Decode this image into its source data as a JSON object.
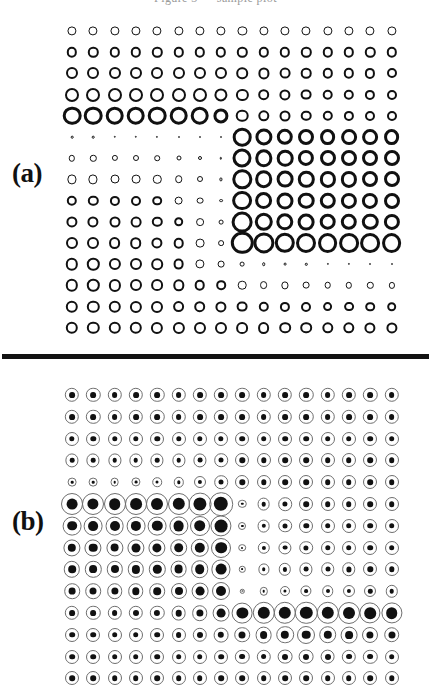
{
  "figure": {
    "header_text_clipped": "Figure 3 — sample plot",
    "background_color": "#ffffff",
    "ink_color": "#111111",
    "thin_ring_color": "#6e6e6e",
    "width_px": 431,
    "height_px": 697,
    "divider": {
      "color": "#121212",
      "x": 2,
      "y": 354,
      "width": 427,
      "height": 5
    }
  },
  "panels": [
    {
      "id": "a",
      "label": "(a)",
      "label_x": 12,
      "label_y": 160,
      "glyph_style": "ring",
      "grid": {
        "rows": 15,
        "cols": 16,
        "x0": 72,
        "dx": 21.3,
        "y0": 21,
        "dy": 21.2
      },
      "note": "Hinton-style diagram: open rings whose radius encodes magnitude.",
      "radii": [
        [
          4.6,
          4.6,
          4.6,
          4.6,
          4.6,
          4.6,
          4.6,
          4.6,
          4.6,
          4.6,
          4.6,
          4.6,
          4.6,
          4.6,
          4.6,
          4.6
        ],
        [
          5.2,
          5.2,
          5.2,
          5.2,
          5.2,
          5.2,
          5.2,
          5.2,
          5.2,
          5.2,
          5.2,
          5.2,
          5.2,
          5.2,
          5.2,
          5.2
        ],
        [
          6.0,
          6.0,
          6.0,
          6.0,
          6.0,
          6.0,
          6.0,
          6.0,
          5.8,
          5.6,
          5.4,
          5.3,
          5.2,
          5.2,
          5.1,
          5.0
        ],
        [
          7.0,
          7.0,
          7.0,
          7.0,
          7.0,
          7.0,
          7.0,
          6.6,
          6.1,
          5.8,
          5.6,
          5.4,
          5.3,
          5.2,
          5.1,
          5.0
        ],
        [
          9.3,
          9.3,
          9.3,
          9.3,
          9.3,
          9.3,
          9.3,
          7.6,
          6.3,
          5.7,
          5.5,
          5.3,
          5.2,
          5.1,
          5.0,
          5.0
        ],
        [
          1.3,
          1.3,
          1.2,
          1.2,
          1.1,
          1.0,
          0.9,
          0.7,
          9.3,
          8.6,
          8.2,
          8.0,
          7.9,
          7.9,
          7.9,
          7.9
        ],
        [
          3.2,
          3.2,
          3.1,
          3.0,
          2.8,
          2.5,
          2.0,
          1.2,
          9.5,
          8.7,
          8.3,
          8.1,
          8.0,
          8.0,
          8.0,
          8.0
        ],
        [
          4.6,
          4.6,
          4.5,
          4.4,
          4.2,
          3.8,
          3.0,
          1.6,
          9.7,
          8.8,
          8.4,
          8.2,
          8.1,
          8.1,
          8.0,
          8.0
        ],
        [
          5.2,
          5.2,
          5.1,
          5.0,
          4.8,
          4.4,
          3.4,
          1.9,
          9.9,
          8.9,
          8.5,
          8.3,
          8.2,
          8.1,
          8.1,
          8.0
        ],
        [
          5.6,
          5.6,
          5.5,
          5.4,
          5.2,
          4.8,
          3.9,
          2.4,
          10.4,
          9.2,
          8.7,
          8.4,
          8.3,
          8.2,
          8.2,
          8.1
        ],
        [
          6.0,
          6.0,
          5.9,
          5.8,
          5.6,
          5.3,
          4.4,
          2.9,
          11.2,
          10.6,
          10.2,
          10.0,
          9.9,
          9.9,
          9.9,
          9.9
        ],
        [
          6.2,
          6.2,
          6.1,
          6.0,
          5.8,
          5.4,
          4.6,
          3.4,
          2.4,
          1.8,
          1.4,
          1.2,
          1.1,
          1.1,
          1.0,
          1.0
        ],
        [
          6.2,
          6.2,
          6.1,
          6.0,
          5.9,
          5.7,
          5.3,
          4.8,
          4.3,
          3.9,
          3.6,
          3.4,
          3.3,
          3.2,
          3.2,
          3.1
        ],
        [
          6.2,
          6.2,
          6.2,
          6.1,
          6.0,
          5.9,
          5.8,
          5.6,
          5.4,
          5.2,
          5.1,
          5.0,
          4.9,
          4.9,
          4.8,
          4.8
        ],
        [
          6.2,
          6.2,
          6.2,
          6.2,
          6.1,
          6.1,
          6.0,
          6.0,
          5.9,
          5.9,
          5.8,
          5.8,
          5.7,
          5.7,
          5.6,
          5.6
        ]
      ]
    },
    {
      "id": "b",
      "label": "(b)",
      "label_x": 12,
      "label_y": 508,
      "glyph_style": "ring-with-dot",
      "grid": {
        "rows": 14,
        "cols": 16,
        "x0": 72,
        "dx": 21.3,
        "y0": 17,
        "dy": 21.8
      },
      "note": "Same layout rendered with a thin outer ring plus a solid inner disc.",
      "outer_radii": [
        [
          7.2,
          7.2,
          7.2,
          7.2,
          7.2,
          7.2,
          7.2,
          7.2,
          7.2,
          7.2,
          7.2,
          7.2,
          7.2,
          7.2,
          7.2,
          7.2
        ],
        [
          7.2,
          7.2,
          7.2,
          7.2,
          7.2,
          7.2,
          7.2,
          7.2,
          7.2,
          7.2,
          7.2,
          7.2,
          7.2,
          7.2,
          7.2,
          7.2
        ],
        [
          7.0,
          7.0,
          7.0,
          7.0,
          7.0,
          7.0,
          7.0,
          7.0,
          7.0,
          7.0,
          7.0,
          7.0,
          7.0,
          7.0,
          7.0,
          7.0
        ],
        [
          6.6,
          6.6,
          6.6,
          6.6,
          6.6,
          6.6,
          6.6,
          6.8,
          7.0,
          7.0,
          7.0,
          7.0,
          7.0,
          7.0,
          7.0,
          7.0
        ],
        [
          4.4,
          4.4,
          4.4,
          4.6,
          4.8,
          5.2,
          6.0,
          6.8,
          7.0,
          7.0,
          7.0,
          7.0,
          7.0,
          7.0,
          7.0,
          7.0
        ],
        [
          11.0,
          11.0,
          11.0,
          11.0,
          11.0,
          11.0,
          11.4,
          11.8,
          4.2,
          6.4,
          6.8,
          7.0,
          7.0,
          7.0,
          7.0,
          7.0
        ],
        [
          9.4,
          9.4,
          9.4,
          9.4,
          9.4,
          9.6,
          10.0,
          10.6,
          4.0,
          6.4,
          6.8,
          7.0,
          7.0,
          7.0,
          7.0,
          7.0
        ],
        [
          8.6,
          8.6,
          8.6,
          8.6,
          8.6,
          8.8,
          9.2,
          10.0,
          3.8,
          6.2,
          6.6,
          6.8,
          7.0,
          7.0,
          7.0,
          7.0
        ],
        [
          8.2,
          8.2,
          8.2,
          8.2,
          8.2,
          8.4,
          8.8,
          9.6,
          3.2,
          5.6,
          6.2,
          6.6,
          6.8,
          6.8,
          7.0,
          7.0
        ],
        [
          7.8,
          7.8,
          7.8,
          7.8,
          7.8,
          8.0,
          8.4,
          9.0,
          2.2,
          4.2,
          5.0,
          5.6,
          5.8,
          6.0,
          6.0,
          6.2
        ],
        [
          7.2,
          7.2,
          7.2,
          7.2,
          7.2,
          7.4,
          7.8,
          8.4,
          10.4,
          11.2,
          11.2,
          11.2,
          11.2,
          11.0,
          10.6,
          10.6
        ],
        [
          7.0,
          7.0,
          7.0,
          7.0,
          7.0,
          7.0,
          7.2,
          7.4,
          7.8,
          8.4,
          8.8,
          9.0,
          8.8,
          8.4,
          8.0,
          7.8
        ],
        [
          7.0,
          7.0,
          7.0,
          7.0,
          7.0,
          7.0,
          7.0,
          7.0,
          7.2,
          7.2,
          7.4,
          7.4,
          7.4,
          7.2,
          7.2,
          7.0
        ],
        [
          7.0,
          7.0,
          7.0,
          7.0,
          7.0,
          7.0,
          7.0,
          7.0,
          7.0,
          7.0,
          7.0,
          7.0,
          7.0,
          7.0,
          7.0,
          7.0
        ]
      ],
      "inner_radii": [
        [
          2.9,
          2.9,
          2.9,
          2.9,
          2.9,
          2.9,
          2.9,
          2.9,
          2.9,
          2.9,
          2.9,
          2.9,
          2.9,
          2.9,
          2.9,
          2.9
        ],
        [
          2.9,
          2.9,
          2.9,
          2.9,
          2.9,
          2.9,
          2.9,
          2.9,
          2.9,
          2.9,
          2.9,
          2.9,
          2.9,
          2.9,
          2.9,
          2.9
        ],
        [
          2.7,
          2.7,
          2.7,
          2.7,
          2.7,
          2.7,
          2.7,
          2.7,
          2.8,
          2.8,
          2.8,
          2.8,
          2.8,
          2.8,
          2.8,
          2.8
        ],
        [
          2.3,
          2.3,
          2.3,
          2.3,
          2.3,
          2.3,
          2.4,
          2.5,
          2.7,
          2.7,
          2.8,
          2.8,
          2.8,
          2.8,
          2.8,
          2.8
        ],
        [
          1.3,
          1.3,
          1.3,
          1.4,
          1.5,
          1.7,
          2.1,
          2.5,
          2.7,
          2.7,
          2.8,
          2.8,
          2.8,
          2.8,
          2.8,
          2.8
        ],
        [
          5.4,
          5.6,
          5.8,
          5.9,
          6.0,
          6.2,
          6.6,
          7.2,
          1.2,
          2.3,
          2.6,
          2.8,
          2.8,
          2.8,
          2.8,
          2.8
        ],
        [
          4.8,
          4.9,
          5.0,
          5.1,
          5.2,
          5.4,
          5.8,
          6.4,
          1.1,
          2.2,
          2.5,
          2.7,
          2.8,
          2.8,
          2.8,
          2.8
        ],
        [
          4.2,
          4.3,
          4.4,
          4.5,
          4.6,
          4.8,
          5.2,
          5.8,
          1.0,
          2.1,
          2.4,
          2.6,
          2.7,
          2.8,
          2.8,
          2.8
        ],
        [
          3.8,
          3.9,
          4.0,
          4.1,
          4.2,
          4.4,
          4.8,
          5.4,
          0.9,
          1.8,
          2.1,
          2.4,
          2.5,
          2.6,
          2.7,
          2.7
        ],
        [
          3.4,
          3.5,
          3.6,
          3.7,
          3.8,
          4.0,
          4.4,
          5.0,
          0.6,
          1.3,
          1.6,
          1.9,
          2.0,
          2.1,
          2.2,
          2.3
        ],
        [
          2.9,
          2.9,
          2.9,
          3.0,
          3.1,
          3.3,
          3.6,
          4.4,
          5.6,
          6.2,
          6.2,
          6.2,
          6.2,
          6.0,
          5.8,
          5.8
        ],
        [
          2.8,
          2.8,
          2.8,
          2.8,
          2.8,
          2.9,
          3.0,
          3.2,
          3.5,
          3.9,
          4.2,
          4.3,
          4.2,
          3.9,
          3.6,
          3.5
        ],
        [
          2.8,
          2.8,
          2.8,
          2.8,
          2.8,
          2.8,
          2.8,
          2.8,
          2.9,
          2.9,
          3.0,
          3.0,
          3.0,
          2.9,
          2.9,
          2.8
        ],
        [
          2.8,
          2.8,
          2.8,
          2.8,
          2.8,
          2.8,
          2.8,
          2.8,
          2.8,
          2.8,
          2.8,
          2.8,
          2.8,
          2.8,
          2.8,
          2.7
        ]
      ]
    }
  ]
}
